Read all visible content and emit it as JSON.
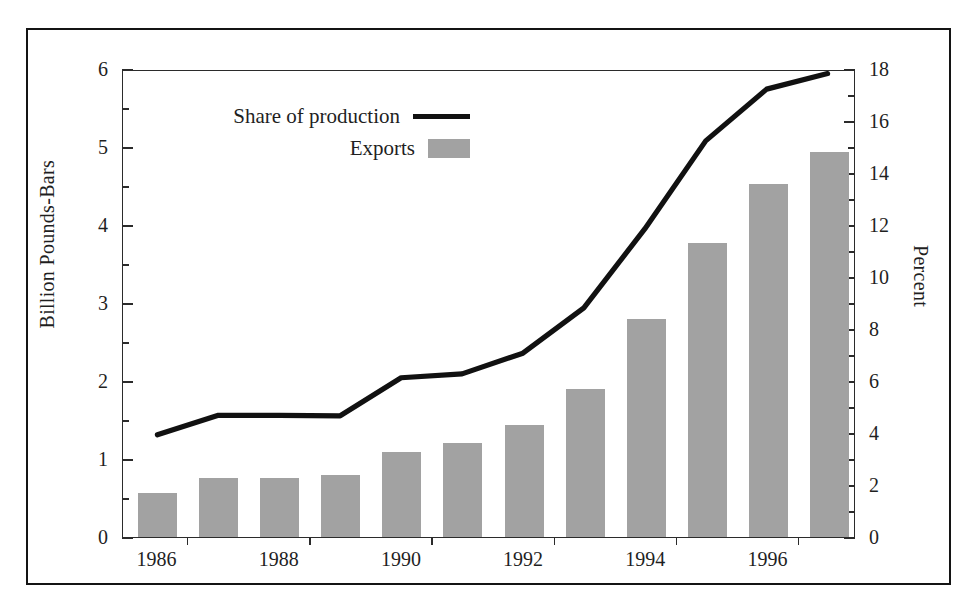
{
  "chart_data": {
    "type": "bar",
    "title": "",
    "subtitle": "",
    "xlabel": "",
    "ylabel": "Billion Pounds-Bars",
    "y2label": "Percent",
    "grid": false,
    "legend_position": "top-left",
    "categories": [
      "1986",
      "1987",
      "1988",
      "1989",
      "1990",
      "1991",
      "1992",
      "1993",
      "1994",
      "1995",
      "1996",
      "1997"
    ],
    "x_tick_labels": [
      "1986",
      "1988",
      "1990",
      "1992",
      "1994",
      "1996"
    ],
    "ylim": [
      0,
      6
    ],
    "y_ticks": [
      0,
      1,
      2,
      3,
      4,
      5,
      6
    ],
    "y_minor_ticks": [
      0.5,
      1.5,
      2.5,
      3.5,
      4.5,
      5.5
    ],
    "y2lim": [
      0,
      18
    ],
    "y2_ticks": [
      0,
      2,
      4,
      6,
      8,
      10,
      12,
      14,
      16,
      18
    ],
    "y2_minor_ticks": [
      1,
      3,
      5,
      7,
      9,
      11,
      13,
      15,
      17
    ],
    "series": [
      {
        "name": "Exports",
        "type": "bar",
        "axis": "left",
        "units": "Billion Pounds",
        "color": "#a2a2a2",
        "values": [
          0.57,
          0.76,
          0.76,
          0.8,
          1.09,
          1.21,
          1.43,
          1.9,
          2.8,
          3.77,
          4.53,
          4.93
        ]
      },
      {
        "name": "Share of production",
        "type": "line",
        "axis": "right",
        "units": "Percent",
        "color": "#111111",
        "values": [
          3.95,
          4.7,
          4.7,
          4.68,
          6.15,
          6.3,
          7.1,
          8.85,
          11.9,
          15.3,
          17.3,
          17.9
        ]
      }
    ]
  },
  "legend": {
    "items": [
      {
        "label": "Share of production",
        "marker": "line-swatch",
        "color": "#111111"
      },
      {
        "label": "Exports",
        "marker": "bar-swatch",
        "color": "#a2a2a2"
      }
    ]
  },
  "axes": {
    "left_title": "Billion Pounds-Bars",
    "right_title": "Percent"
  },
  "colors": {
    "bar_fill": "#a2a2a2",
    "line_stroke": "#111111",
    "axis_stroke": "#2b2b2b",
    "frame_stroke": "#141414",
    "background": "#ffffff",
    "text": "#1f1f1f"
  }
}
